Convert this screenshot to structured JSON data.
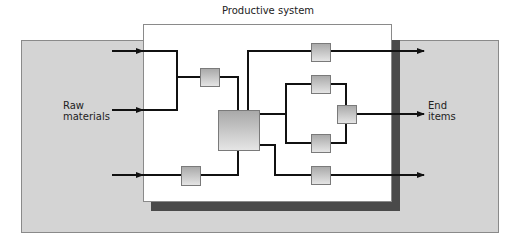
{
  "title": "Productive system",
  "inputs_label": "Raw\nmaterials",
  "outputs_label": "End\nitems",
  "colors": {
    "background_panel": "#d4d4d4",
    "panel_border": "#8a8a8a",
    "system_box": "#ffffff",
    "shadow": "#4a4a4a",
    "line": "#111111",
    "node_light": "#e4e4e4",
    "node_dark": "#9a9a9a",
    "node_border": "#7a7a7a"
  },
  "nodes": [
    {
      "id": "n1",
      "x": 200,
      "y": 68,
      "w": 19,
      "h": 18
    },
    {
      "id": "n-main",
      "x": 218,
      "y": 110,
      "w": 41,
      "h": 40
    },
    {
      "id": "n-bottom-left",
      "x": 181,
      "y": 166,
      "w": 19,
      "h": 19
    },
    {
      "id": "n-top-right",
      "x": 311,
      "y": 43,
      "w": 19,
      "h": 19
    },
    {
      "id": "n-upper-branch",
      "x": 311,
      "y": 75,
      "w": 19,
      "h": 18
    },
    {
      "id": "n-merge",
      "x": 337,
      "y": 105,
      "w": 19,
      "h": 18
    },
    {
      "id": "n-lower-branch",
      "x": 311,
      "y": 134,
      "w": 19,
      "h": 19
    },
    {
      "id": "n-bottom-right",
      "x": 311,
      "y": 166,
      "w": 19,
      "h": 18
    }
  ]
}
